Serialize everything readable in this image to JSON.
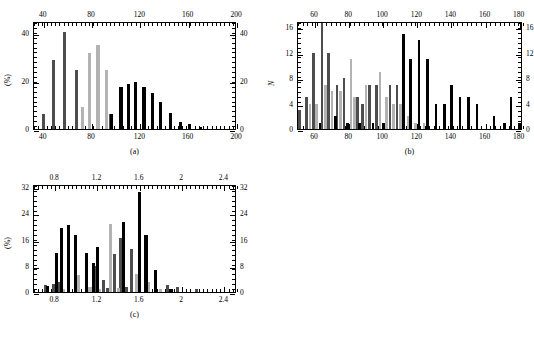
{
  "figure": {
    "background": "#ffffff",
    "series_colors": {
      "dark_gray": "#4d4d4d",
      "light_gray": "#b3b3b3",
      "black": "#000000"
    }
  },
  "chart_data": [
    {
      "id": "panel-a",
      "type": "bar",
      "title": "",
      "caption": "(a)",
      "xlabel": "",
      "ylabel": "(%)",
      "xlim": [
        32,
        200
      ],
      "ylim": [
        0,
        45
      ],
      "xticks": [
        40,
        80,
        120,
        160,
        200
      ],
      "xtick_labels": [
        "40",
        "80",
        "120",
        "160",
        "200"
      ],
      "yticks": [
        0,
        20,
        40
      ],
      "ytick_labels": [
        "0",
        "20",
        "40"
      ],
      "top_axis": true,
      "right_axis": true,
      "grid": false,
      "legend": "none",
      "series": [
        {
          "name": "dark_gray",
          "color": "#4d4d4d",
          "points": [
            {
              "x": 40,
              "y": 6.3
            },
            {
              "x": 48,
              "y": 28.7
            },
            {
              "x": 57,
              "y": 40.6
            },
            {
              "x": 67,
              "y": 24.7
            },
            {
              "x": 95,
              "y": 6.4
            }
          ]
        },
        {
          "name": "light_gray",
          "color": "#b3b3b3",
          "points": [
            {
              "x": 72,
              "y": 9.0
            },
            {
              "x": 78,
              "y": 31.5
            },
            {
              "x": 85,
              "y": 35.0
            },
            {
              "x": 92,
              "y": 24.7
            }
          ]
        },
        {
          "name": "black",
          "color": "#000000",
          "points": [
            {
              "x": 96,
              "y": 6.4
            },
            {
              "x": 104,
              "y": 17.6
            },
            {
              "x": 110,
              "y": 18.7
            },
            {
              "x": 116,
              "y": 19.4
            },
            {
              "x": 123,
              "y": 17.3
            },
            {
              "x": 130,
              "y": 15.1
            },
            {
              "x": 137,
              "y": 11.3
            },
            {
              "x": 145,
              "y": 6.7
            },
            {
              "x": 153,
              "y": 3.0
            },
            {
              "x": 161,
              "y": 1.9
            },
            {
              "x": 170,
              "y": 0.8
            }
          ]
        }
      ]
    },
    {
      "id": "panel-b",
      "type": "bar",
      "title": "",
      "caption": "(b)",
      "xlabel": "",
      "ylabel": "N",
      "xlim": [
        50,
        182
      ],
      "ylim": [
        0,
        17
      ],
      "xticks": [
        60,
        80,
        100,
        120,
        140,
        160,
        180
      ],
      "xtick_labels": [
        "60",
        "80",
        "100",
        "120",
        "140",
        "160",
        "180"
      ],
      "yticks": [
        0,
        4,
        8,
        12,
        16
      ],
      "ytick_labels": [
        "0",
        "4",
        "8",
        "12",
        "16"
      ],
      "top_axis": true,
      "right_axis": true,
      "grid": false,
      "legend": "none",
      "series": [
        {
          "name": "dark_gray",
          "color": "#4d4d4d",
          "points": [
            {
              "x": 51,
              "y": 3
            },
            {
              "x": 55,
              "y": 5
            },
            {
              "x": 59,
              "y": 12
            },
            {
              "x": 64,
              "y": 17
            },
            {
              "x": 68,
              "y": 12
            },
            {
              "x": 73,
              "y": 7
            },
            {
              "x": 77,
              "y": 8
            },
            {
              "x": 85,
              "y": 5
            },
            {
              "x": 88,
              "y": 4
            },
            {
              "x": 92,
              "y": 7
            },
            {
              "x": 96,
              "y": 7
            },
            {
              "x": 104,
              "y": 7
            },
            {
              "x": 108,
              "y": 7
            }
          ]
        },
        {
          "name": "light_gray",
          "color": "#b3b3b3",
          "points": [
            {
              "x": 57,
              "y": 4
            },
            {
              "x": 61,
              "y": 4
            },
            {
              "x": 66,
              "y": 7
            },
            {
              "x": 70,
              "y": 6
            },
            {
              "x": 75,
              "y": 6
            },
            {
              "x": 81,
              "y": 11
            },
            {
              "x": 83,
              "y": 5
            },
            {
              "x": 90,
              "y": 7
            },
            {
              "x": 98,
              "y": 9
            },
            {
              "x": 102,
              "y": 5
            },
            {
              "x": 106,
              "y": 4
            },
            {
              "x": 110,
              "y": 4
            },
            {
              "x": 115,
              "y": 2
            },
            {
              "x": 119,
              "y": 1
            },
            {
              "x": 124,
              "y": 1
            }
          ]
        },
        {
          "name": "black",
          "color": "#000000",
          "points": [
            {
              "x": 63,
              "y": 1
            },
            {
              "x": 72,
              "y": 2
            },
            {
              "x": 79,
              "y": 1
            },
            {
              "x": 86,
              "y": 1
            },
            {
              "x": 94,
              "y": 1
            },
            {
              "x": 100,
              "y": 1
            },
            {
              "x": 112,
              "y": 15
            },
            {
              "x": 116,
              "y": 11
            },
            {
              "x": 121,
              "y": 14
            },
            {
              "x": 126,
              "y": 11
            },
            {
              "x": 131,
              "y": 4
            },
            {
              "x": 136,
              "y": 4
            },
            {
              "x": 140,
              "y": 7
            },
            {
              "x": 145,
              "y": 5
            },
            {
              "x": 150,
              "y": 5
            },
            {
              "x": 155,
              "y": 4
            },
            {
              "x": 165,
              "y": 2
            },
            {
              "x": 171,
              "y": 1
            },
            {
              "x": 175,
              "y": 5
            },
            {
              "x": 180,
              "y": 1
            }
          ]
        }
      ]
    },
    {
      "id": "panel-c",
      "type": "bar",
      "title": "",
      "caption": "(c)",
      "xlabel": "",
      "ylabel": "(%)",
      "xlim": [
        0.6,
        2.52
      ],
      "ylim": [
        0,
        33
      ],
      "xticks": [
        0.8,
        1.2,
        1.6,
        2.0,
        2.4
      ],
      "xtick_labels": [
        "0.8",
        "1.2",
        "1.6",
        "2",
        "2.4"
      ],
      "yticks": [
        0,
        8,
        16,
        24,
        32
      ],
      "ytick_labels": [
        "0",
        "8",
        "16",
        "24",
        "32"
      ],
      "top_axis": true,
      "right_axis": true,
      "grid": false,
      "legend": "none",
      "series": [
        {
          "name": "dark_gray",
          "color": "#4d4d4d",
          "points": [
            {
              "x": 0.71,
              "y": 2.0
            },
            {
              "x": 0.79,
              "y": 2.3
            },
            {
              "x": 0.84,
              "y": 3.2
            },
            {
              "x": 1.18,
              "y": 8.0
            },
            {
              "x": 1.26,
              "y": 3.6
            },
            {
              "x": 1.3,
              "y": 1.2
            },
            {
              "x": 1.36,
              "y": 11.6
            },
            {
              "x": 1.42,
              "y": 16.5
            },
            {
              "x": 1.47,
              "y": 1.6
            },
            {
              "x": 1.52,
              "y": 13.0
            },
            {
              "x": 1.86,
              "y": 2.0
            },
            {
              "x": 1.96,
              "y": 1.5
            },
            {
              "x": 2.14,
              "y": 0.8
            }
          ]
        },
        {
          "name": "light_gray",
          "color": "#b3b3b3",
          "points": [
            {
              "x": 0.88,
              "y": 1.0
            },
            {
              "x": 1.02,
              "y": 5.2
            },
            {
              "x": 1.13,
              "y": 1.6
            },
            {
              "x": 1.22,
              "y": 1.0
            },
            {
              "x": 1.32,
              "y": 20.7
            },
            {
              "x": 1.4,
              "y": 1.2
            },
            {
              "x": 1.57,
              "y": 5.6
            },
            {
              "x": 1.68,
              "y": 3.2
            },
            {
              "x": 1.8,
              "y": 1.0
            }
          ]
        },
        {
          "name": "black",
          "color": "#000000",
          "points": [
            {
              "x": 0.73,
              "y": 1.8
            },
            {
              "x": 0.81,
              "y": 11.8
            },
            {
              "x": 0.86,
              "y": 19.5
            },
            {
              "x": 0.93,
              "y": 20.5
            },
            {
              "x": 0.99,
              "y": 17.4
            },
            {
              "x": 1.1,
              "y": 12.0
            },
            {
              "x": 1.16,
              "y": 9.0
            },
            {
              "x": 1.2,
              "y": 13.7
            },
            {
              "x": 1.45,
              "y": 21.5
            },
            {
              "x": 1.6,
              "y": 30.5
            },
            {
              "x": 1.66,
              "y": 17.3
            },
            {
              "x": 1.75,
              "y": 6.8
            },
            {
              "x": 1.9,
              "y": 1.0
            }
          ]
        }
      ]
    }
  ]
}
